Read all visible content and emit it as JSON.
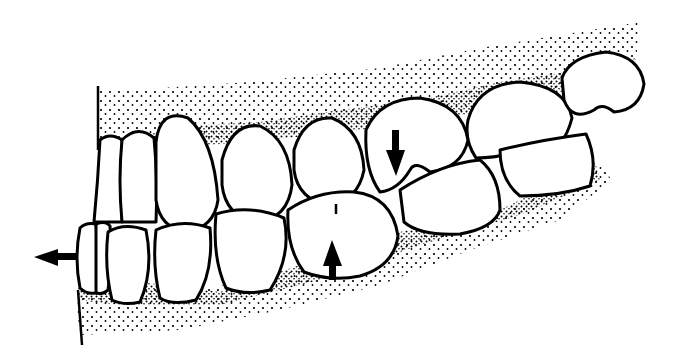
{
  "illustration": {
    "subject": "Lateral view of dental arch in occlusion (line drawing)",
    "colors": {
      "background": "#ffffff",
      "line": "#000000",
      "stipple": "#000000"
    },
    "upper_teeth_count": 8,
    "lower_teeth_count": 7,
    "arrows": [
      {
        "name": "anterior-displacement-arrow",
        "direction": "left",
        "location": "lower incisors"
      },
      {
        "name": "upper-molar-arrow",
        "direction": "down",
        "location": "upper first molar"
      },
      {
        "name": "lower-molar-arrow",
        "direction": "up",
        "location": "lower first molar"
      }
    ]
  }
}
